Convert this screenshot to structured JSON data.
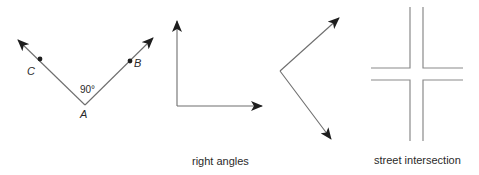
{
  "figures": {
    "labeled_angle": {
      "vertex_label": "A",
      "point_left_label": "C",
      "point_right_label": "B",
      "angle_measure": "90°"
    },
    "right_angle_1": {},
    "right_angle_2": {},
    "street_intersection": {}
  },
  "captions": {
    "right_angles": "right angles",
    "street_intersection": "street intersection"
  },
  "colors": {
    "line": "#6e6e6e",
    "arrowhead": "#1e1e1e",
    "road": "#8a8a8a",
    "text": "#2a2a2a",
    "background": "#ffffff"
  }
}
